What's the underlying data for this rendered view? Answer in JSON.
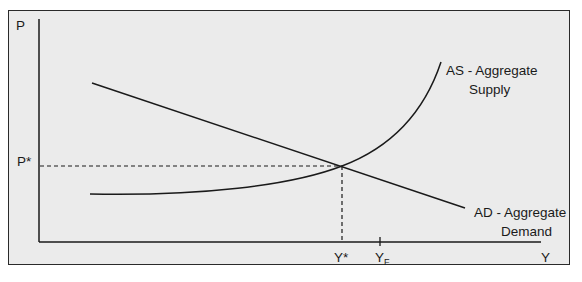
{
  "diagram": {
    "axes": {
      "y_label": "P",
      "x_label": "Y"
    },
    "markers": {
      "price_equilibrium": "P*",
      "output_equilibrium": "Y*",
      "full_employment_base": "Y",
      "full_employment_sub": "F"
    },
    "curves": {
      "as_line1": "AS - Aggregate",
      "as_line2": "Supply",
      "ad_line1": "AD - Aggregate",
      "ad_line2": "Demand"
    },
    "colors": {
      "background": "#ebebeb",
      "line": "#1a1a1a",
      "border": "#2a2a2a"
    }
  }
}
